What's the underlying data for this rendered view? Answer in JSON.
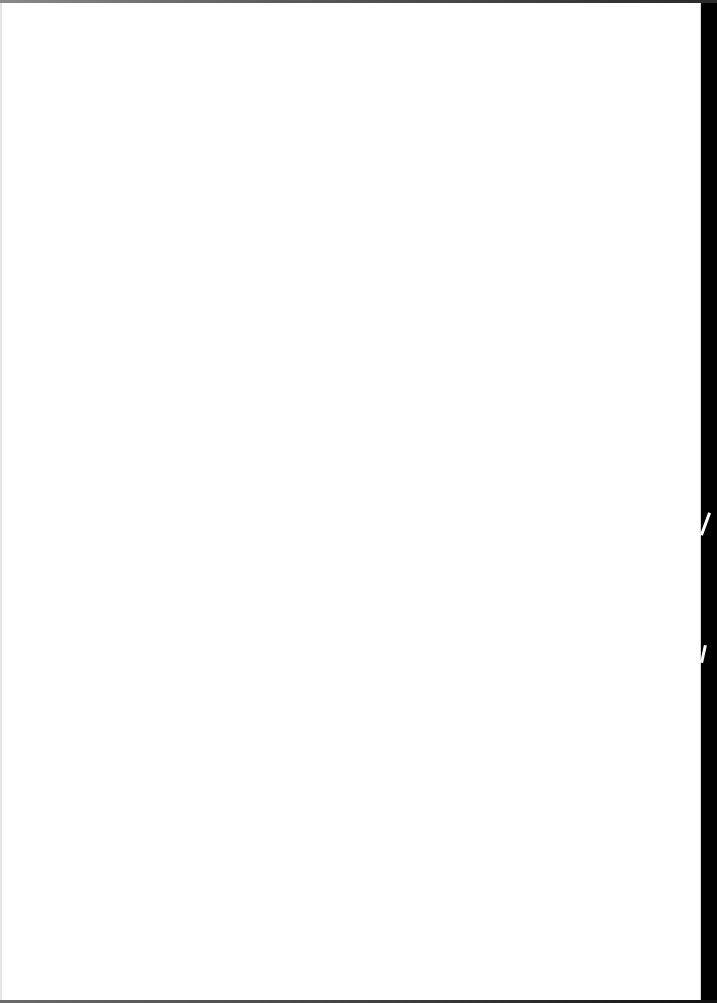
{
  "document": {
    "type": "blank-scanned-page",
    "paper_color": "#ffffff",
    "background_color": "#000000"
  }
}
